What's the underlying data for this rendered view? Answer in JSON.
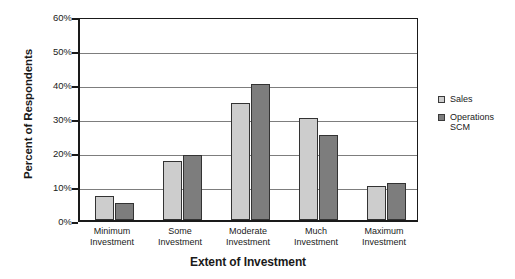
{
  "chart_data": {
    "type": "bar",
    "title": "",
    "subtitle": "",
    "xlabel": "Extent of Investment",
    "ylabel": "Percent of Respondents",
    "categories": [
      "Minimum\nInvestment",
      "Some Investment",
      "Moderate\nInvestment",
      "Much Investment",
      "Maximum\nInvestment"
    ],
    "series": [
      {
        "name": "Sales",
        "values": [
          7,
          17.5,
          34.5,
          30,
          10
        ],
        "color": "#cdcdcd"
      },
      {
        "name": "Operations\nSCM",
        "values": [
          5,
          19,
          40,
          25,
          11
        ],
        "color": "#7d7d7d"
      }
    ],
    "ylim": [
      0,
      60
    ],
    "ytick_labels": [
      "60%",
      "50%",
      "40%",
      "30%",
      "20%",
      "10%",
      "0%"
    ],
    "ytick_values": [
      60,
      50,
      40,
      30,
      20,
      10,
      0
    ],
    "grid": true,
    "legend_position": "right",
    "axis_color": "#1a1a1a",
    "gridline_color": "#7d7d7d",
    "background": "#ffffff"
  },
  "legend": {
    "entries": [
      {
        "label": "Sales"
      },
      {
        "label": "Operations\nSCM"
      }
    ]
  }
}
